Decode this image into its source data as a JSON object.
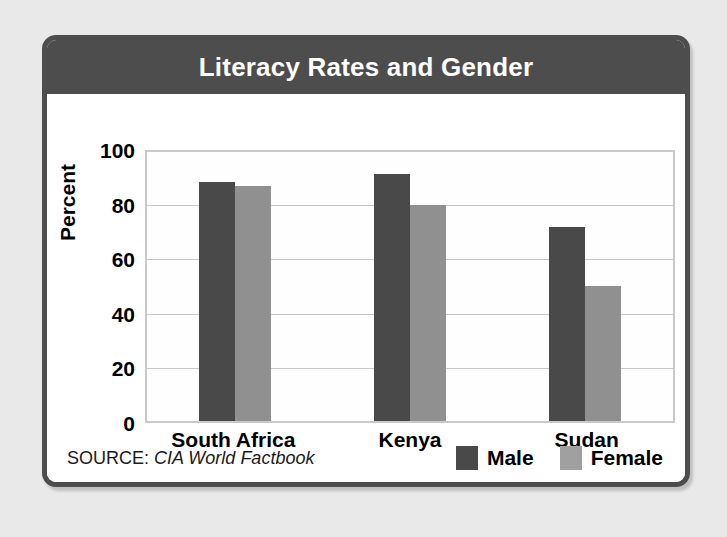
{
  "card": {
    "title": "Literacy Rates and Gender",
    "source_label": "SOURCE:",
    "source_value": "CIA World Factbook"
  },
  "colors": {
    "header_bg": "#4d4d4d",
    "card_border": "#4d4d4d",
    "page_bg": "#e9e9e9",
    "male": "#494949",
    "female": "#909090",
    "gridline": "#c9c9c9"
  },
  "chart_data": {
    "type": "bar",
    "title": "Literacy Rates and Gender",
    "xlabel": "",
    "ylabel": "Percent",
    "ylim": [
      0,
      100
    ],
    "yticks": [
      0,
      20,
      40,
      60,
      80,
      100
    ],
    "ytick_labels": [
      "0",
      "20",
      "40",
      "60",
      "80",
      "100"
    ],
    "grid": true,
    "legend_position": "bottom-right",
    "categories": [
      "South Africa",
      "Kenya",
      "Sudan"
    ],
    "series": [
      {
        "name": "Male",
        "color": "#494949",
        "values": [
          87.5,
          90.5,
          71
        ]
      },
      {
        "name": "Female",
        "color": "#909090",
        "values": [
          86,
          79,
          49.5
        ]
      }
    ],
    "source": "SOURCE: CIA World Factbook"
  }
}
